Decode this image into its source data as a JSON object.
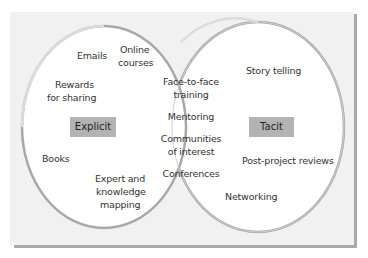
{
  "diagram": {
    "type": "venn",
    "colors": {
      "background": "#f1f1f1",
      "circle_fill": "#ffffff",
      "circle_stroke": "#a8a8a8",
      "tag_fill": "#b3b3b3",
      "shadow": "#a9a9a9"
    },
    "sets": {
      "explicit": {
        "label": "Explicit",
        "items": [
          "Emails",
          "Online courses",
          "Rewards for sharing",
          "Books",
          "Expert and knowledge mapping"
        ],
        "display": {
          "emails": "Emails",
          "online_1": "Online",
          "online_2": "courses",
          "rewards_1": "Rewards",
          "rewards_2": "for sharing",
          "books": "Books",
          "expert_1": "Expert and",
          "expert_2": "knowledge",
          "expert_3": "mapping"
        }
      },
      "tacit": {
        "label": "Tacit",
        "items": [
          "Story telling",
          "Post-project reviews",
          "Networking"
        ],
        "display": {
          "story": "Story telling",
          "postproject": "Post-project reviews",
          "networking": "Networking"
        }
      },
      "overlap": {
        "items": [
          "Face-to-face training",
          "Mentoring",
          "Communities of interest",
          "Conferences"
        ],
        "display": {
          "f2f_1": "Face-to-face",
          "f2f_2": "training",
          "mentoring": "Mentoring",
          "communities_1": "Communities",
          "communities_2": "of interest",
          "conferences": "Conferences"
        }
      }
    }
  }
}
